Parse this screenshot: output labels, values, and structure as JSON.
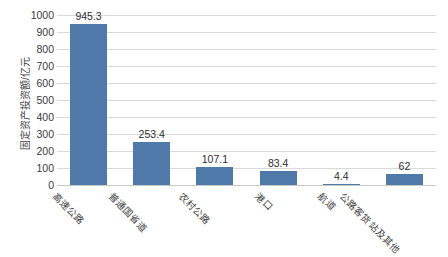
{
  "chart_data": {
    "type": "bar",
    "title": "",
    "subtitle": "",
    "xlabel": "",
    "ylabel": "固定资产投资额/亿元",
    "categories": [
      "高速公路",
      "普通国省道",
      "农村公路",
      "港口",
      "航道",
      "公路客货站及其他"
    ],
    "values": [
      945.3,
      253.4,
      107.1,
      83.4,
      4.4,
      62
    ],
    "value_labels": [
      "945.3",
      "253.4",
      "107.1",
      "83.4",
      "4.4",
      "62"
    ],
    "ylim": [
      0,
      1000
    ],
    "ytick_labels": [
      "1000",
      "900",
      "800",
      "700",
      "600",
      "500",
      "400",
      "300",
      "200",
      "100",
      "0"
    ],
    "ytick_values": [
      1000,
      900,
      800,
      700,
      600,
      500,
      400,
      300,
      200,
      100,
      0
    ],
    "ystep": 100,
    "grid": true,
    "grid_axis": "y",
    "legend": false,
    "legend_position": "none",
    "series_color": "#4e79a8",
    "grid_color": "#d9d9d9",
    "axis_color": "#c9c9c9",
    "text_color": "#3f3f3f"
  }
}
